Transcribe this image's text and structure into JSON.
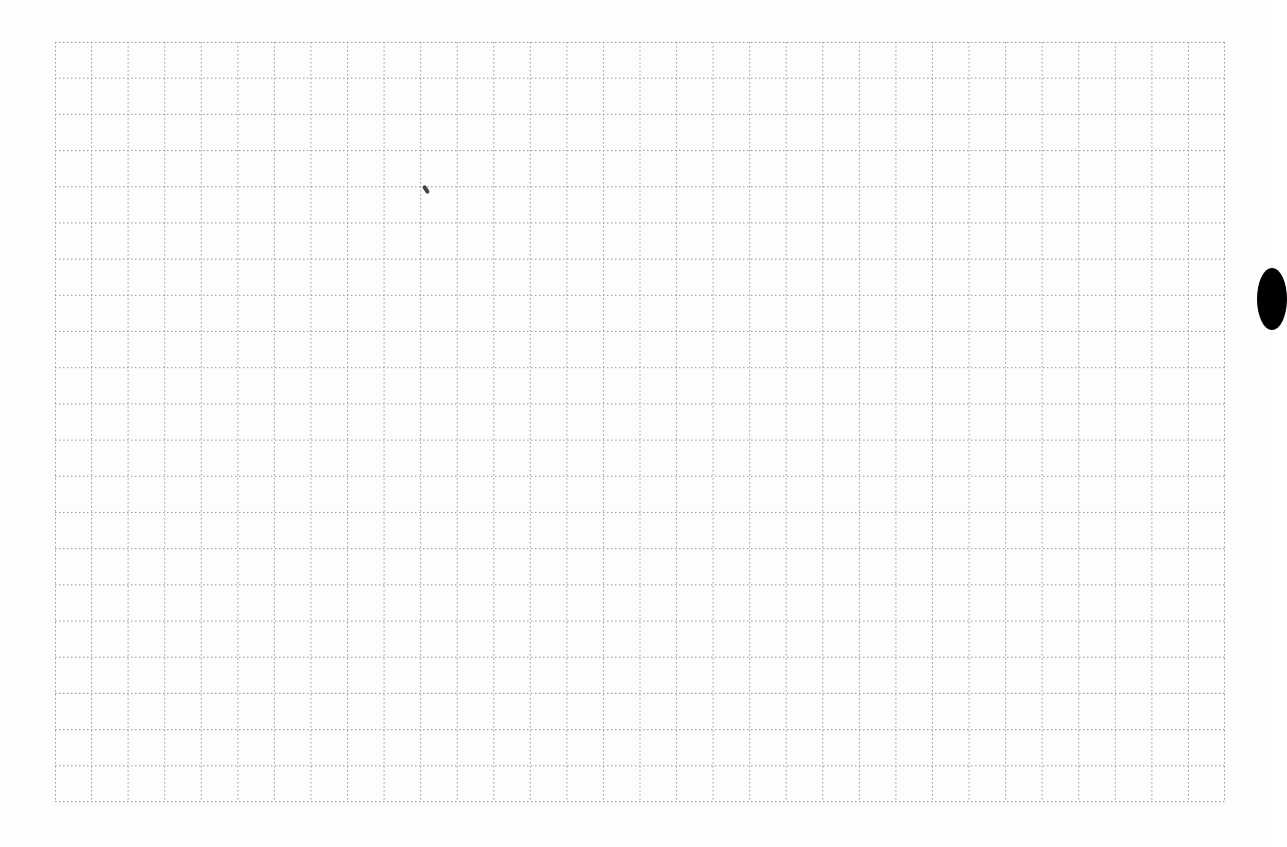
{
  "page": {
    "type": "graph-paper",
    "grid": {
      "columns": 32,
      "rows": 21,
      "line_style": "dotted",
      "line_color": "#9a9a9a"
    },
    "background_color": "#fdfdfc",
    "artifacts": [
      "pen-mark",
      "punch-hole"
    ]
  }
}
